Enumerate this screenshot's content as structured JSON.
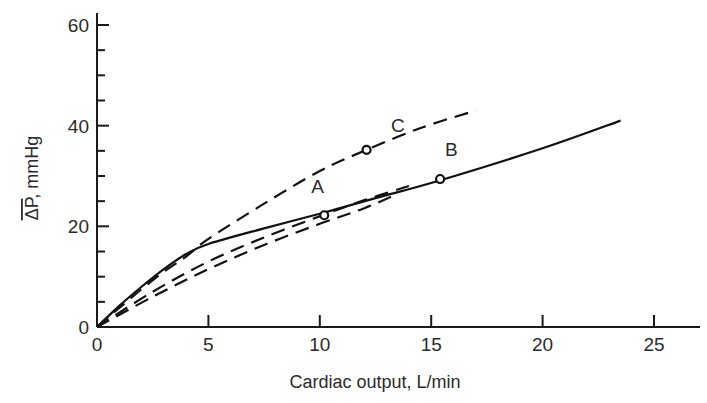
{
  "chart_data": {
    "type": "line",
    "title": "",
    "xlabel": "Cardiac output, L/min",
    "ylabel": "ΔP, mmHg",
    "ylabel_overline": "ΔP",
    "ylabel_unit": ", mmHg",
    "xlim": [
      0,
      27
    ],
    "ylim": [
      0,
      63
    ],
    "x_ticks": [
      0,
      5,
      10,
      15,
      20,
      25
    ],
    "x_tick_labels": [
      "0",
      "5",
      "10",
      "15",
      "20",
      "25"
    ],
    "y_ticks": [
      0,
      20,
      40,
      60
    ],
    "y_tick_labels": [
      "0",
      "20",
      "40",
      "60"
    ],
    "y_minor_ticks": [
      5,
      10,
      15,
      25,
      30,
      35,
      45,
      50,
      55
    ],
    "grid": false,
    "legend": "none",
    "series": [
      {
        "name": "B (solid)",
        "style": "solid",
        "points": [
          [
            0,
            0
          ],
          [
            1,
            4.2
          ],
          [
            2,
            8
          ],
          [
            3,
            11.5
          ],
          [
            4,
            14.5
          ],
          [
            5,
            16.5
          ],
          [
            7.5,
            19.6
          ],
          [
            10,
            22.5
          ],
          [
            12.5,
            25.6
          ],
          [
            15.3,
            29
          ],
          [
            20,
            35.5
          ],
          [
            23.5,
            41
          ]
        ]
      },
      {
        "name": "C (dashed)",
        "style": "dashed",
        "points": [
          [
            0,
            0
          ],
          [
            1,
            3.8
          ],
          [
            2,
            7.5
          ],
          [
            3,
            11
          ],
          [
            4,
            14
          ],
          [
            5,
            17.5
          ],
          [
            7.5,
            24.5
          ],
          [
            10,
            31
          ],
          [
            12,
            35
          ],
          [
            14.5,
            39.5
          ],
          [
            17,
            43
          ]
        ]
      },
      {
        "name": "A upper (dashed)",
        "style": "dashed",
        "points": [
          [
            0,
            0
          ],
          [
            2.5,
            7
          ],
          [
            5,
            13
          ],
          [
            7.5,
            17.8
          ],
          [
            10,
            22
          ],
          [
            12,
            25.2
          ],
          [
            14,
            28
          ]
        ]
      },
      {
        "name": "A lower (dashed)",
        "style": "dashed",
        "points": [
          [
            0,
            0
          ],
          [
            2.5,
            6
          ],
          [
            5,
            11.5
          ],
          [
            7.5,
            16.3
          ],
          [
            10,
            20.5
          ],
          [
            12,
            23.6
          ],
          [
            13.5,
            26.5
          ]
        ]
      }
    ],
    "markers": [
      {
        "label": "A",
        "x": 10.2,
        "y": 22.2,
        "label_dx": -0.3,
        "label_dy": 4.5
      },
      {
        "label": "B",
        "x": 15.4,
        "y": 29.4,
        "label_dx": 0.5,
        "label_dy": 4.5
      },
      {
        "label": "C",
        "x": 12.1,
        "y": 35.2,
        "label_dx": 1.4,
        "label_dy": 3.6
      }
    ]
  }
}
